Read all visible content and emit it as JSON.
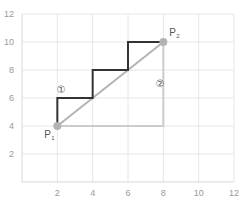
{
  "chart_data": {
    "type": "line",
    "title": "",
    "xlabel": "",
    "ylabel": "",
    "xlim": [
      0,
      12
    ],
    "ylim": [
      0,
      12
    ],
    "grid": true,
    "x_ticks": [
      2,
      4,
      6,
      8,
      10,
      12
    ],
    "y_ticks": [
      2,
      4,
      6,
      8,
      10,
      12
    ],
    "points": [
      {
        "name": "P1",
        "label": "P",
        "sub": "1",
        "x": 2,
        "y": 4
      },
      {
        "name": "P2",
        "label": "P",
        "sub": "2",
        "x": 8,
        "y": 10
      }
    ],
    "series": [
      {
        "name": "path-1-staircase",
        "color": "#333333",
        "x": [
          2,
          2,
          4,
          4,
          6,
          6,
          8
        ],
        "y": [
          4,
          6,
          6,
          8,
          8,
          10,
          10
        ]
      },
      {
        "name": "path-2-right-angle",
        "color": "#cccccc",
        "x": [
          2,
          8,
          8
        ],
        "y": [
          4,
          4,
          10
        ]
      },
      {
        "name": "diagonal",
        "color": "#b3b3b3",
        "x": [
          2,
          8
        ],
        "y": [
          4,
          10
        ]
      }
    ],
    "annotations": [
      {
        "text": "①",
        "x": 2.2,
        "y": 6.6
      },
      {
        "text": "②",
        "x": 7.8,
        "y": 7.0
      }
    ]
  },
  "colors": {
    "grid": "#e6e6e6",
    "axis": "#d9d9d9",
    "point": "#b3b3b3"
  }
}
